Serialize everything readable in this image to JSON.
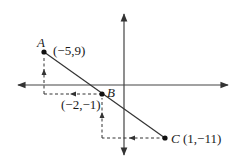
{
  "diagram": {
    "type": "coordinate-plane",
    "colors": {
      "background": "#ffffff",
      "stroke": "#333333",
      "text": "#1a1a1a"
    },
    "points": [
      {
        "name": "A",
        "coords": "(−5,9)",
        "x": -5,
        "y": 9
      },
      {
        "name": "B",
        "coords": "(−2,−1)",
        "x": -2,
        "y": -1
      },
      {
        "name": "C",
        "coords": "(1,−11)",
        "x": 1,
        "y": -11
      }
    ],
    "segment": {
      "from": "A",
      "to": "C",
      "passes_through": "B"
    },
    "step_arrows": [
      {
        "from": "B",
        "to": "A",
        "run_direction": "left",
        "rise_direction": "up"
      },
      {
        "from": "C",
        "to": "B",
        "run_direction": "left",
        "rise_direction": "up"
      }
    ],
    "axes": {
      "x_arrows": "both",
      "y_arrows": "both",
      "ticks": false
    }
  }
}
